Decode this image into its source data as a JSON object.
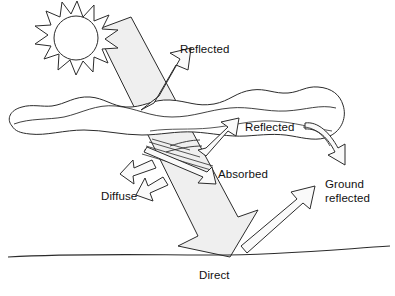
{
  "diagram": {
    "type": "solar-radiation-schematic",
    "colors": {
      "stroke": "#2b2b2b",
      "beam_fill": "#efefef",
      "arrow_fill": "#f4f4f4",
      "background": "#ffffff",
      "text": "#111111"
    },
    "labels": [
      {
        "id": "reflected-top",
        "text": "Reflected",
        "x": 180,
        "y": 43
      },
      {
        "id": "reflected-cloud",
        "text": "Reflected",
        "x": 245,
        "y": 121
      },
      {
        "id": "absorbed",
        "text": "Absorbed",
        "x": 218,
        "y": 168
      },
      {
        "id": "diffuse",
        "text": "Diffuse",
        "x": 101,
        "y": 190
      },
      {
        "id": "ground-reflected",
        "text": "Ground\nreflected",
        "x": 325,
        "y": 178
      },
      {
        "id": "direct",
        "text": "Direct",
        "x": 199,
        "y": 269
      }
    ],
    "elements": [
      {
        "id": "sun",
        "name": "sun",
        "rays": 11
      },
      {
        "id": "cloud",
        "name": "cloud"
      },
      {
        "id": "beam",
        "name": "incoming-solar-beam"
      },
      {
        "id": "ground",
        "name": "ground-line"
      },
      {
        "id": "arrow-reflected-top",
        "name": "reflected-top-arrow"
      },
      {
        "id": "arrow-reflected-cloud",
        "name": "reflected-cloud-arrow"
      },
      {
        "id": "arrow-cloud-down",
        "name": "cloud-downward-arrow"
      },
      {
        "id": "arrow-absorbed",
        "name": "absorbed-arrow"
      },
      {
        "id": "arrow-diffuse-1",
        "name": "diffuse-arrow-upper"
      },
      {
        "id": "arrow-diffuse-2",
        "name": "diffuse-arrow-lower"
      },
      {
        "id": "arrow-ground-reflected",
        "name": "ground-reflected-arrow"
      },
      {
        "id": "scatter-lines",
        "name": "scatter-lines"
      }
    ]
  }
}
